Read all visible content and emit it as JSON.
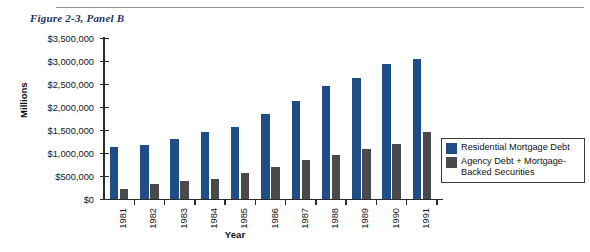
{
  "figure": {
    "title": "Figure 2-3, Panel B"
  },
  "colors": {
    "series_residential": "#1f4e86",
    "series_agency": "#4a4a4a",
    "axis": "#2b2b2b",
    "title": "#16355f",
    "rule": "#8f96a3"
  },
  "legend": {
    "position": "right",
    "entries": [
      {
        "label": "Residential Mortgage Debt",
        "color": "#1f4e86"
      },
      {
        "label": "Agency Debt + Mortgage-Backed Securities",
        "color": "#4a4a4a"
      }
    ]
  },
  "chart_data": {
    "type": "bar",
    "title": "Figure 2-3, Panel B",
    "xlabel": "Year",
    "ylabel": "Millions",
    "categories": [
      "1981",
      "1982",
      "1983",
      "1984",
      "1985",
      "1986",
      "1987",
      "1988",
      "1989",
      "1990",
      "1991"
    ],
    "series": [
      {
        "name": "Residential Mortgage Debt",
        "color": "#1f4e86",
        "values": [
          1130000,
          1180000,
          1300000,
          1450000,
          1570000,
          1850000,
          2130000,
          2450000,
          2620000,
          2940000,
          3050000
        ]
      },
      {
        "name": "Agency Debt + Mortgage-Backed Securities",
        "color": "#4a4a4a",
        "values": [
          220000,
          330000,
          390000,
          430000,
          560000,
          690000,
          840000,
          960000,
          1090000,
          1200000,
          1450000
        ]
      }
    ],
    "ylim": [
      0,
      3500000
    ],
    "ytick_values": [
      0,
      500000,
      1000000,
      1500000,
      2000000,
      2500000,
      3000000,
      3500000
    ],
    "ytick_labels": [
      "$0",
      "$500,000",
      "$1,000,000",
      "$1,500,000",
      "$2,000,000",
      "$2,500,000",
      "$3,000,000",
      "$3,500,000"
    ],
    "grid": false,
    "legend_position": "right"
  }
}
